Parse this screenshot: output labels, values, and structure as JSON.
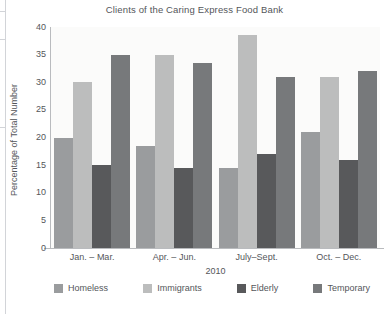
{
  "chart_data": {
    "type": "bar",
    "title": "Clients of the Caring Express Food Bank",
    "xlabel": "2010",
    "ylabel": "Percentage of Total Number",
    "categories": [
      "Jan. – Mar.",
      "Apr. – Jun.",
      "July–Sept.",
      "Oct. – Dec."
    ],
    "series": [
      {
        "name": "Homeless",
        "color": "#9a9c9e",
        "values": [
          20,
          18.5,
          14.5,
          21
        ]
      },
      {
        "name": "Immigrants",
        "color": "#bcbdbd",
        "values": [
          30,
          35,
          38.5,
          31
        ]
      },
      {
        "name": "Elderly",
        "color": "#58595b",
        "values": [
          15,
          14.5,
          17,
          16
        ]
      },
      {
        "name": "Temporary",
        "color": "#77797b",
        "values": [
          35,
          33.5,
          31,
          32
        ]
      }
    ],
    "ylim": [
      0,
      40
    ],
    "yticks": [
      "0",
      "5",
      "10",
      "15",
      "20",
      "25",
      "30",
      "35",
      "40"
    ],
    "grid": false,
    "legend_position": "bottom"
  }
}
